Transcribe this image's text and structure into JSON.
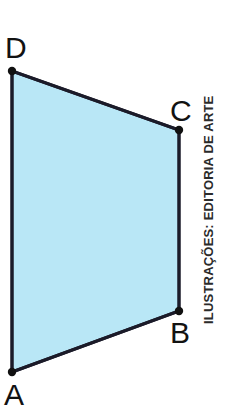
{
  "figure": {
    "name": "quadrilateral-abcd",
    "background_color": "#ffffff",
    "width": 238,
    "height": 418,
    "shape": {
      "type": "quadrilateral",
      "fill_color": "#b9e7f6",
      "stroke_color": "#1b1b29",
      "stroke_width": 3,
      "vertex_dot_color": "#111111",
      "vertex_dot_radius": 4,
      "points": "12,372 179,311 179,130 12,71",
      "vertices": [
        {
          "id": "A",
          "x": 12,
          "y": 372
        },
        {
          "id": "B",
          "x": 179,
          "y": 311
        },
        {
          "id": "C",
          "x": 179,
          "y": 130
        },
        {
          "id": "D",
          "x": 12,
          "y": 71
        }
      ],
      "edges": [
        {
          "id": "AB",
          "from": "A",
          "to": "B"
        },
        {
          "id": "BC",
          "from": "B",
          "to": "C"
        },
        {
          "id": "CD",
          "from": "C",
          "to": "D"
        },
        {
          "id": "DA",
          "from": "D",
          "to": "A"
        }
      ]
    },
    "labels": {
      "a": "A",
      "b": "B",
      "c": "C",
      "d": "D"
    },
    "credit": {
      "text": "ILUSTRAÇÕES: EDITORIA DE ARTE",
      "color": "#2b2b2b",
      "orientation": "vertical-rotated-90-ccw"
    }
  }
}
